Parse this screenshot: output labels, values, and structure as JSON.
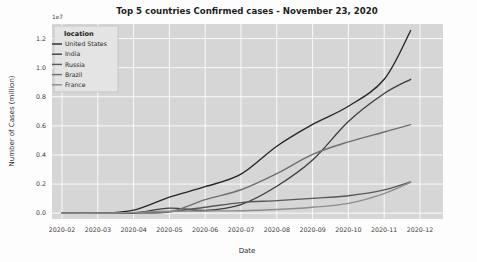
{
  "figure": {
    "background": "#fdfdfd",
    "plot_background": "#d6d6d6",
    "grid_color": "#ffffff"
  },
  "chart_data": {
    "type": "line",
    "title": "Top 5 countries Confirmed cases - November 23, 2020",
    "xlabel": "Date",
    "ylabel": "Number of Cases (million)",
    "y_offset_text": "1e7",
    "grid": true,
    "legend_position": "upper left",
    "legend_title": "location",
    "x_tick_labels": [
      "2020-02",
      "2020-03",
      "2020-04",
      "2020-05",
      "2020-06",
      "2020-07",
      "2020-08",
      "2020-09",
      "2020-10",
      "2020-11",
      "2020-12"
    ],
    "y_tick_labels": [
      "0.0",
      "0.2",
      "0.4",
      "0.6",
      "0.8",
      "1.0",
      "1.2"
    ],
    "y_tick_values": [
      0.0,
      0.2,
      0.4,
      0.6,
      0.8,
      1.0,
      1.2
    ],
    "ylim": [
      -0.04,
      1.3
    ],
    "xlim": [
      "2020-01-22",
      "2020-12-05"
    ],
    "x": [
      "2020-02",
      "2020-03",
      "2020-04",
      "2020-05",
      "2020-06",
      "2020-07",
      "2020-08",
      "2020-09",
      "2020-10",
      "2020-11",
      "2020-11-23"
    ],
    "series": [
      {
        "name": "United States",
        "color": "#262626",
        "values": [
          0.0,
          0.0001,
          0.021,
          0.11,
          0.182,
          0.268,
          0.46,
          0.61,
          0.735,
          0.92,
          1.255
        ]
      },
      {
        "name": "India",
        "color": "#3d3d3d",
        "values": [
          0.0,
          0.0,
          0.0014,
          0.035,
          0.019,
          0.059,
          0.185,
          0.365,
          0.63,
          0.822,
          0.92
        ]
      },
      {
        "name": "Russia",
        "color": "#575757",
        "values": [
          0.0,
          0.0,
          0.0027,
          0.01,
          0.041,
          0.073,
          0.086,
          0.102,
          0.12,
          0.16,
          0.215
        ]
      },
      {
        "name": "Brazil",
        "color": "#6e6e6e",
        "values": [
          0.0,
          0.0,
          0.0007,
          0.009,
          0.093,
          0.161,
          0.272,
          0.404,
          0.49,
          0.558,
          0.608
        ]
      },
      {
        "name": "France",
        "color": "#8c8c8c",
        "values": [
          0.0,
          0.0001,
          0.006,
          0.013,
          0.015,
          0.017,
          0.025,
          0.041,
          0.067,
          0.135,
          0.212
        ]
      }
    ]
  }
}
